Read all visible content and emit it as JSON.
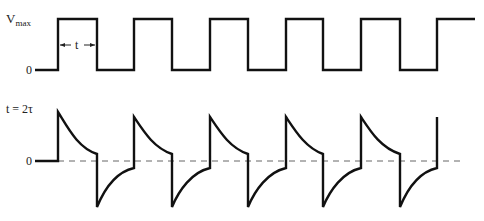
{
  "figure": {
    "top_waveform": {
      "name": "square-wave-input",
      "label_vmax": "V",
      "label_vmax_sub": "max",
      "label_zero": "0",
      "pulse_width_label": "t",
      "edges_x": [
        58,
        97,
        134,
        172,
        210,
        248,
        286,
        323,
        361,
        400,
        437
      ],
      "start_x": 35,
      "end_x": 475,
      "high_y": 19,
      "low_y": 70
    },
    "bottom_waveform": {
      "name": "rc-differentiated-output",
      "condition_label": "t = 2τ",
      "label_zero": "0",
      "zero_y": 161,
      "peak_positive_y": 117,
      "first_peak_y": 112,
      "decayed_positive_y": 154,
      "peak_negative_y": 207,
      "decayed_negative_y": 168,
      "dashed_line_end_x": 460
    },
    "colors": {
      "trace": "#111111",
      "dashed": "#666666",
      "background": "#ffffff"
    }
  }
}
